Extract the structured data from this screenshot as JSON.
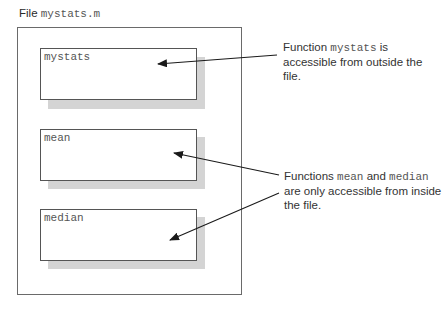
{
  "file_label": {
    "prefix": "File",
    "filename": "mystats.m"
  },
  "functions": [
    {
      "name": "mystats"
    },
    {
      "name": "mean"
    },
    {
      "name": "median"
    }
  ],
  "notes": {
    "public": {
      "prefix": "Function",
      "code": "mystats",
      "suffix": "is",
      "line2": "accessible from outside the file."
    },
    "private": {
      "prefix": "Functions",
      "code1": "mean",
      "and": "and",
      "code2": "median",
      "line2": "are only accessible from inside",
      "line3": "the file."
    }
  }
}
